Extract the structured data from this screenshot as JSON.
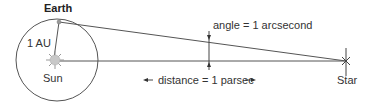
{
  "labels": {
    "earth": "Earth",
    "one_au": "1 AU",
    "sun": "Sun",
    "angle": "angle = 1 arcsecond",
    "distance": "distance = 1 parsec",
    "star": "Star"
  },
  "icons": {
    "sun": "sun-icon",
    "earth": "earth-dot-icon",
    "star": "star-cross-icon"
  },
  "colors": {
    "line": "#555555",
    "text": "#333333",
    "sun": "#bbbbbb"
  }
}
